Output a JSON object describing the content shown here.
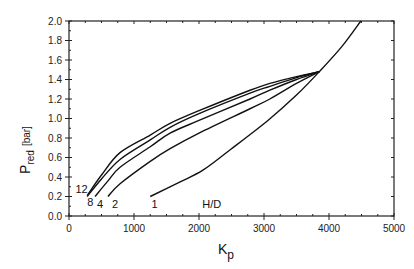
{
  "chart_data": {
    "type": "line",
    "title": "",
    "xlabel": "K_p",
    "xlabel_main": "K",
    "xlabel_sub": "p",
    "ylabel": "P_red [bar]",
    "ylabel_main": "P",
    "ylabel_sub": "red",
    "ylabel_unit": "[bar]",
    "xlim": [
      0,
      5000
    ],
    "ylim": [
      0,
      2.0
    ],
    "x_ticks": [
      0,
      1000,
      2000,
      3000,
      4000,
      5000
    ],
    "x_tick_labels": [
      "0",
      "1000",
      "2000",
      "3000",
      "4000",
      "5000"
    ],
    "y_ticks": [
      0.0,
      0.2,
      0.4,
      0.6,
      0.8,
      1.0,
      1.2,
      1.4,
      1.6,
      1.8,
      2.0
    ],
    "y_tick_labels": [
      "0.0",
      "0.2",
      "0.4",
      "0.6",
      "0.8",
      "1.0",
      "1.2",
      "1.4",
      "1.6",
      "1.8",
      "2.0"
    ],
    "grid": false,
    "legend_title": "H/D",
    "series": [
      {
        "name": "12",
        "x": [
          280,
          500,
          785,
          1250,
          1555,
          2000,
          2785,
          3090,
          3500,
          3850
        ],
        "y": [
          0.21,
          0.42,
          0.65,
          0.83,
          0.95,
          1.08,
          1.29,
          1.36,
          1.43,
          1.48
        ]
      },
      {
        "name": "8",
        "x": [
          280,
          500,
          785,
          1250,
          1555,
          2000,
          2785,
          3090,
          3500,
          3850
        ],
        "y": [
          0.2,
          0.38,
          0.58,
          0.78,
          0.91,
          1.05,
          1.26,
          1.33,
          1.42,
          1.48
        ]
      },
      {
        "name": "4",
        "x": [
          400,
          600,
          785,
          1250,
          1555,
          2000,
          2785,
          3090,
          3500,
          3850
        ],
        "y": [
          0.2,
          0.36,
          0.5,
          0.71,
          0.85,
          0.98,
          1.2,
          1.29,
          1.4,
          1.48
        ]
      },
      {
        "name": "2",
        "x": [
          600,
          785,
          1250,
          1555,
          2000,
          2785,
          3090,
          3500,
          3850
        ],
        "y": [
          0.2,
          0.33,
          0.56,
          0.69,
          0.85,
          1.1,
          1.2,
          1.36,
          1.48
        ]
      },
      {
        "name": "1",
        "x": [
          1250,
          1710,
          2060,
          2480,
          3060,
          3500,
          3850,
          4200,
          4490
        ],
        "y": [
          0.2,
          0.35,
          0.47,
          0.68,
          0.98,
          1.24,
          1.48,
          1.74,
          2.0
        ]
      }
    ],
    "annotations": [
      {
        "text": "12",
        "x": 100,
        "y": 0.28
      },
      {
        "text": "8",
        "x": 280,
        "y": 0.14
      },
      {
        "text": "4",
        "x": 430,
        "y": 0.12
      },
      {
        "text": "2",
        "x": 660,
        "y": 0.12
      },
      {
        "text": "1",
        "x": 1270,
        "y": 0.12
      },
      {
        "text": "H/D",
        "x": 2050,
        "y": 0.12
      }
    ]
  }
}
